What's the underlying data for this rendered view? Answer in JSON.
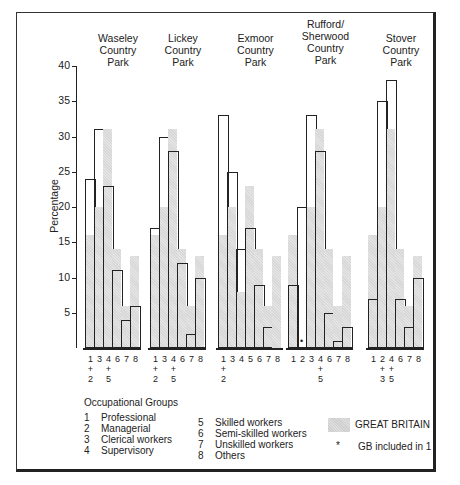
{
  "chart_data": {
    "type": "bar",
    "title": "",
    "ylabel": "Percentage",
    "xlabel": "",
    "ylim": [
      0,
      40
    ],
    "yticks": [
      5,
      10,
      15,
      20,
      25,
      30,
      35,
      40
    ],
    "grid": false,
    "legend_position": "bottom",
    "panels": [
      {
        "name": "Waseley Country Park",
        "title_lines": [
          "Waseley",
          "Country",
          "Park"
        ],
        "categories": [
          "1+2",
          "3",
          "4+5",
          "6",
          "7",
          "8"
        ],
        "x_labels_top": [
          "1",
          "3",
          "4",
          "6",
          "7",
          "8"
        ],
        "x_labels_plus": [
          "+",
          "",
          "+",
          "",
          "",
          ""
        ],
        "x_labels_bottom": [
          "2",
          "",
          "5",
          "",
          "",
          ""
        ],
        "values": [
          24,
          31,
          23,
          11,
          4,
          6
        ],
        "gb_values": [
          16,
          20,
          31,
          14,
          6,
          13
        ]
      },
      {
        "name": "Lickey Country Park",
        "title_lines": [
          "Lickey",
          "Country",
          "Park"
        ],
        "categories": [
          "1+2",
          "3",
          "4+5",
          "6",
          "7",
          "8"
        ],
        "x_labels_top": [
          "1",
          "3",
          "4",
          "6",
          "7",
          "8"
        ],
        "x_labels_plus": [
          "+",
          "",
          "+",
          "",
          "",
          ""
        ],
        "x_labels_bottom": [
          "2",
          "",
          "5",
          "",
          "",
          ""
        ],
        "values": [
          17,
          30,
          28,
          12,
          2,
          10
        ],
        "gb_values": [
          16,
          20,
          31,
          14,
          6,
          13
        ]
      },
      {
        "name": "Exmoor Country Park",
        "title_lines": [
          "Exmoor",
          "Country",
          "Park"
        ],
        "categories": [
          "1+2",
          "3",
          "4",
          "5",
          "6",
          "7",
          "8"
        ],
        "x_labels_top": [
          "1",
          "3",
          "4",
          "5",
          "6",
          "7",
          "8"
        ],
        "x_labels_plus": [
          "+",
          "",
          "",
          "",
          "",
          "",
          ""
        ],
        "x_labels_bottom": [
          "2",
          "",
          "",
          "",
          "",
          "",
          ""
        ],
        "values": [
          33,
          25,
          14,
          17,
          9,
          3,
          0
        ],
        "gb_values": [
          16,
          20,
          8,
          23,
          14,
          6,
          13
        ]
      },
      {
        "name": "Rufford/Sherwood Country Park",
        "title_lines": [
          "Rufford/",
          "Sherwood",
          "Country",
          "Park"
        ],
        "categories": [
          "1",
          "2",
          "3",
          "4+5",
          "6",
          "7",
          "8"
        ],
        "x_labels_top": [
          "1",
          "2",
          "3",
          "4",
          "6",
          "7",
          "8"
        ],
        "x_labels_plus": [
          "",
          "",
          "",
          "+",
          "",
          "",
          ""
        ],
        "x_labels_bottom": [
          "",
          "",
          "",
          "5",
          "",
          "",
          ""
        ],
        "values": [
          9,
          20,
          33,
          28,
          5,
          1,
          3
        ],
        "gb_values": [
          16,
          0,
          20,
          31,
          14,
          6,
          13
        ],
        "annotation": "GB included in 1 (marker on bar 2)"
      },
      {
        "name": "Stover Country Park",
        "title_lines": [
          "Stover",
          "Country",
          "Park"
        ],
        "categories": [
          "1",
          "2+3",
          "4+5",
          "6",
          "7",
          "8"
        ],
        "x_labels_top": [
          "1",
          "2",
          "4",
          "6",
          "7",
          "8"
        ],
        "x_labels_plus": [
          "",
          "+",
          "+",
          "",
          "",
          ""
        ],
        "x_labels_bottom": [
          "",
          "3",
          "5",
          "",
          "",
          ""
        ],
        "values": [
          7,
          35,
          38,
          7,
          3,
          10
        ],
        "gb_values": [
          16,
          20,
          31,
          14,
          6,
          13
        ]
      }
    ],
    "series": [
      {
        "name": "Country park visitors",
        "style": "outlined bar"
      },
      {
        "name": "GREAT BRITAIN",
        "style": "stippled grey bar"
      }
    ],
    "legend": {
      "heading": "Occupational Groups",
      "groups": [
        {
          "num": "1",
          "label": "Professional"
        },
        {
          "num": "2",
          "label": "Managerial"
        },
        {
          "num": "3",
          "label": "Clerical workers"
        },
        {
          "num": "4",
          "label": "Supervisory"
        },
        {
          "num": "5",
          "label": "Skilled workers"
        },
        {
          "num": "6",
          "label": "Semi-skilled workers"
        },
        {
          "num": "7",
          "label": "Unskilled workers"
        },
        {
          "num": "8",
          "label": "Others"
        }
      ],
      "gb_label": "GREAT BRITAIN",
      "marker_symbol": "*",
      "marker_label": "GB included in 1"
    }
  }
}
